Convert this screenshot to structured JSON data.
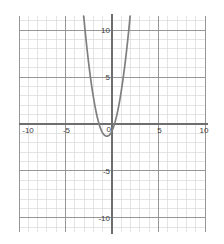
{
  "chart_data": {
    "type": "line",
    "title": "",
    "subtitle": "",
    "xlabel": "",
    "ylabel": "",
    "xlim": [
      -10,
      10
    ],
    "ylim": [
      -11.5,
      11.5
    ],
    "grid": true,
    "minor_grid_step": 1,
    "major_grid_step": 5,
    "legend": "none",
    "curve_color": "#7f7f7f",
    "axis_color": "#6e6e6e",
    "major_grid_color": "#8c8c8c",
    "minor_grid_color": "#d9d9d9",
    "label_color": "#3c3c3c",
    "background": "#ffffff",
    "equation": "y = 1.8(x + 0.55)^2 - 2",
    "vertex": [
      -0.55,
      -2
    ],
    "roots": [
      -1.6,
      0.5
    ],
    "series": [
      {
        "name": "parabola",
        "points": [
          [
            -3.05,
            11.5
          ],
          [
            -3.0,
            11.04
          ],
          [
            -2.9,
            10.02
          ],
          [
            -2.8,
            9.05
          ],
          [
            -2.7,
            8.12
          ],
          [
            -2.6,
            7.24
          ],
          [
            -2.5,
            6.4
          ],
          [
            -2.4,
            5.6
          ],
          [
            -2.3,
            4.85
          ],
          [
            -2.2,
            4.14
          ],
          [
            -2.1,
            3.47
          ],
          [
            -2.0,
            2.85
          ],
          [
            -1.9,
            2.27
          ],
          [
            -1.8,
            1.74
          ],
          [
            -1.7,
            1.25
          ],
          [
            -1.6,
            0.8
          ],
          [
            -1.5,
            0.4
          ],
          [
            -1.4,
            0.04
          ],
          [
            -1.3,
            -0.28
          ],
          [
            -1.2,
            -0.55
          ],
          [
            -1.1,
            -0.78
          ],
          [
            -1.0,
            -0.96
          ],
          [
            -0.9,
            -1.1
          ],
          [
            -0.8,
            -1.2
          ],
          [
            -0.7,
            -1.26
          ],
          [
            -0.6,
            -1.29
          ],
          [
            -0.55,
            -1.3
          ],
          [
            -0.5,
            -1.3
          ],
          [
            -0.4,
            -1.26
          ],
          [
            -0.3,
            -1.19
          ],
          [
            -0.2,
            -1.08
          ],
          [
            -0.1,
            -0.92
          ],
          [
            0.0,
            -0.73
          ],
          [
            0.1,
            -0.49
          ],
          [
            0.2,
            -0.21
          ],
          [
            0.3,
            0.1
          ],
          [
            0.4,
            0.47
          ],
          [
            0.5,
            0.87
          ],
          [
            0.6,
            1.32
          ],
          [
            0.7,
            1.8
          ],
          [
            0.8,
            2.33
          ],
          [
            0.9,
            2.9
          ],
          [
            1.0,
            3.52
          ],
          [
            1.1,
            4.18
          ],
          [
            1.2,
            4.88
          ],
          [
            1.3,
            5.62
          ],
          [
            1.4,
            6.4
          ],
          [
            1.5,
            7.23
          ],
          [
            1.6,
            8.1
          ],
          [
            1.7,
            9.01
          ],
          [
            1.8,
            9.96
          ],
          [
            1.9,
            10.96
          ],
          [
            1.95,
            11.5
          ]
        ]
      }
    ],
    "x_ticks": [
      {
        "value": -10,
        "label": "-10"
      },
      {
        "value": -5,
        "label": "-5"
      },
      {
        "value": 5,
        "label": "5"
      },
      {
        "value": 10,
        "label": "10"
      }
    ],
    "y_ticks": [
      {
        "value": 10,
        "label": "10"
      },
      {
        "value": 5,
        "label": "5"
      },
      {
        "value": -5,
        "label": "-5"
      },
      {
        "value": -10,
        "label": "-10"
      }
    ],
    "origin_tick": {
      "value": 0,
      "label": "0"
    }
  }
}
